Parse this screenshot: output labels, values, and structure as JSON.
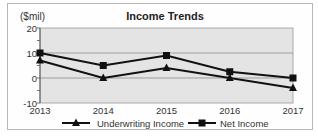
{
  "chart_data": {
    "type": "line",
    "title": "Income Trends",
    "ylabel": "($mil)",
    "xlabel": "",
    "x": [
      "2013",
      "2014",
      "2015",
      "2016",
      "2017"
    ],
    "ylim": [
      -10,
      20
    ],
    "yticks": [
      20,
      10,
      0,
      -10
    ],
    "grid": true,
    "legend_position": "bottom",
    "series": [
      {
        "name": "Underwriting Income",
        "marker": "triangle",
        "color": "#111111",
        "values": [
          7,
          0,
          4,
          0,
          -4
        ]
      },
      {
        "name": "Net Income",
        "marker": "square",
        "color": "#111111",
        "values": [
          10,
          5,
          9,
          2.5,
          0
        ]
      }
    ]
  },
  "colors": {
    "plot_background": "#e4e4e4",
    "gridline": "#8a8a8a",
    "line": "#111111"
  }
}
